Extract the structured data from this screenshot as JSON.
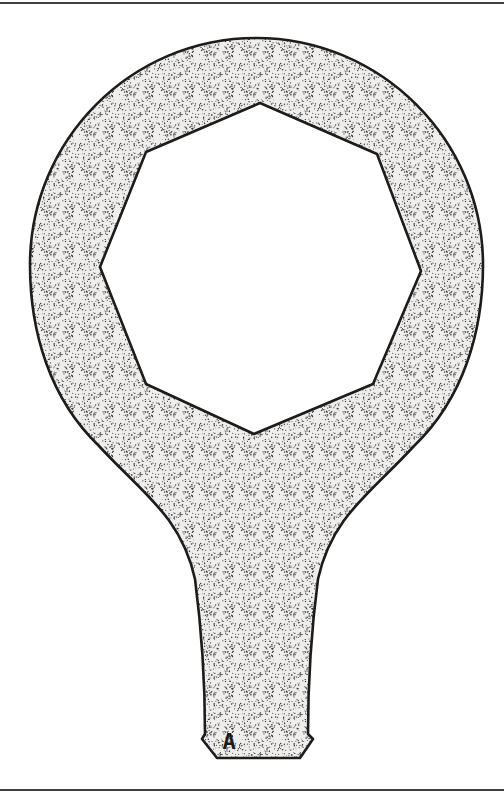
{
  "figure": {
    "part_label": "A",
    "depicts": "single-piece ring spanner (box wrench) with octagonal opening, stipple shading"
  },
  "colors": {
    "background": "#ffffff",
    "outline": "#1c1c1c",
    "fill_base": "#efeeec",
    "stipple_dot": "#3c3c3c",
    "rule": "#3f3f3f"
  }
}
